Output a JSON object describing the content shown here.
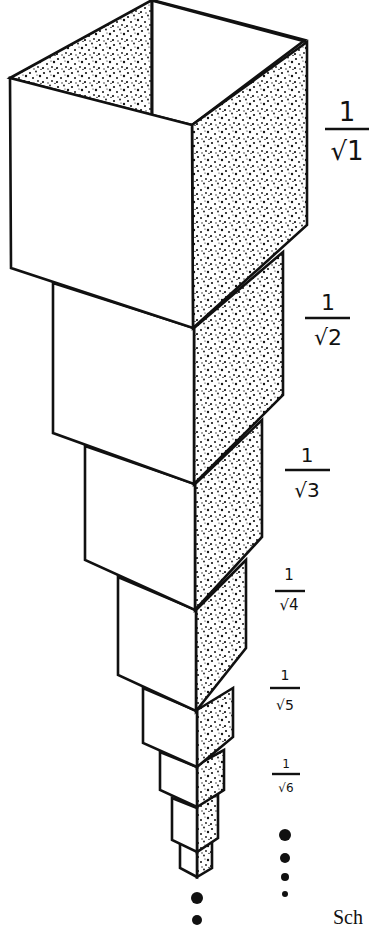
{
  "figure": {
    "labels": [
      {
        "numerator": "1",
        "radicand": "1",
        "x": 347,
        "num_y": 121,
        "bar_y": 129,
        "bar_x1": 325,
        "bar_x2": 369,
        "rad_y": 160,
        "size": 26
      },
      {
        "numerator": "1",
        "radicand": "2",
        "x": 328,
        "num_y": 310,
        "bar_y": 318,
        "bar_x1": 305,
        "bar_x2": 350,
        "rad_y": 345,
        "size": 22
      },
      {
        "numerator": "1",
        "radicand": "3",
        "x": 307,
        "num_y": 462,
        "bar_y": 470,
        "bar_x1": 285,
        "bar_x2": 330,
        "rad_y": 497,
        "size": 20
      },
      {
        "numerator": "1",
        "radicand": "4",
        "x": 289,
        "num_y": 580,
        "bar_y": 591,
        "bar_x1": 275,
        "bar_x2": 305,
        "rad_y": 610,
        "size": 15
      },
      {
        "numerator": "1",
        "radicand": "5",
        "x": 285,
        "num_y": 680,
        "bar_y": 688,
        "bar_x1": 270,
        "bar_x2": 300,
        "rad_y": 710,
        "size": 14
      },
      {
        "numerator": "1",
        "radicand": "6",
        "x": 286,
        "num_y": 768,
        "bar_y": 774,
        "bar_x1": 272,
        "bar_x2": 300,
        "rad_y": 792,
        "size": 12
      }
    ],
    "continuation_dots_right": [
      {
        "cx": 285,
        "cy": 835,
        "r": 6
      },
      {
        "cx": 285,
        "cy": 858,
        "r": 5
      },
      {
        "cx": 285,
        "cy": 877,
        "r": 4
      },
      {
        "cx": 285,
        "cy": 894,
        "r": 3
      }
    ],
    "continuation_dots_bottom": [
      {
        "cx": 197,
        "cy": 898,
        "r": 6
      },
      {
        "cx": 197,
        "cy": 920,
        "r": 5
      }
    ],
    "caption_fragment": "Sch"
  },
  "colors": {
    "ink": "#111111",
    "paper": "#ffffff"
  }
}
